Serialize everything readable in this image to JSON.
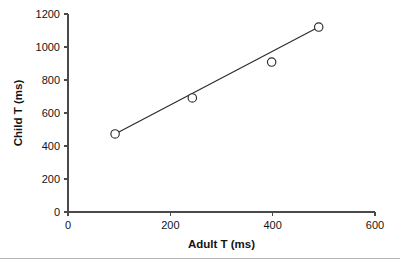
{
  "chart_data": {
    "type": "scatter",
    "title": "",
    "xlabel": "Adult T (ms)",
    "ylabel": "Child T (ms)",
    "xlim": [
      0,
      600
    ],
    "ylim": [
      0,
      1200
    ],
    "xticks": [
      0,
      200,
      400,
      600
    ],
    "yticks": [
      0,
      200,
      400,
      600,
      800,
      1000,
      1200
    ],
    "xtick_labels": [
      "0",
      "200",
      "400",
      "600"
    ],
    "ytick_labels": [
      "0",
      "200",
      "400",
      "600",
      "800",
      "1000",
      "1200"
    ],
    "grid": false,
    "legend": false,
    "marker": "open-circle",
    "points": [
      {
        "x": 92,
        "y": 473
      },
      {
        "x": 243,
        "y": 691
      },
      {
        "x": 398,
        "y": 909
      },
      {
        "x": 490,
        "y": 1121
      }
    ],
    "series": [
      {
        "name": "Child vs Adult T",
        "x": [
          92,
          243,
          398,
          490
        ],
        "values": [
          473,
          691,
          909,
          1121
        ]
      }
    ],
    "fit_line": {
      "name": "regression-line",
      "x_start": 92,
      "y_start": 473,
      "x_end": 490,
      "y_end": 1121
    }
  },
  "figure": {
    "footer_rule_visible": true
  }
}
